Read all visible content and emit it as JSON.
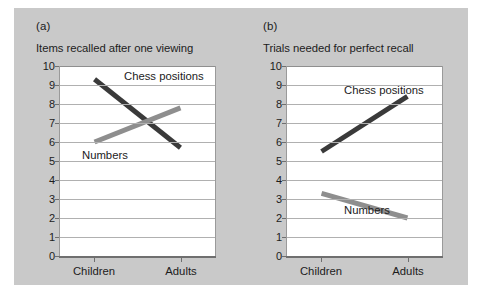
{
  "figure": {
    "background_color": "#c9c9c9",
    "plot_background_color": "#ffffff",
    "gridline_color": "#b0b0b0",
    "series_colors": {
      "chess_positions": "#3a3a3a",
      "numbers": "#8e8e8e"
    }
  },
  "panels": [
    {
      "label": "(a)",
      "title": "Items recalled after one viewing",
      "chess_label": "Chess positions",
      "numbers_label": "Numbers",
      "xticks": [
        "Children",
        "Adults"
      ],
      "yticks": [
        "10",
        "9",
        "8",
        "7",
        "6",
        "5",
        "4",
        "3",
        "2",
        "1",
        "0"
      ]
    },
    {
      "label": "(b)",
      "title": "Trials needed for perfect recall",
      "chess_label": "Chess positions",
      "numbers_label": "Numbers",
      "xticks": [
        "Children",
        "Adults"
      ],
      "yticks": [
        "10",
        "9",
        "8",
        "7",
        "6",
        "5",
        "4",
        "3",
        "2",
        "1",
        "0"
      ]
    }
  ],
  "chart_data": [
    {
      "type": "line",
      "title": "Items recalled after one viewing",
      "panel": "(a)",
      "xlabel": "",
      "ylabel": "",
      "categories": [
        "Children",
        "Adults"
      ],
      "ylim": [
        0,
        10
      ],
      "yticks": [
        0,
        1,
        2,
        3,
        4,
        5,
        6,
        7,
        8,
        9,
        10
      ],
      "grid": true,
      "legend": "inline-labels",
      "series": [
        {
          "name": "Chess positions",
          "values": [
            9.3,
            5.7
          ],
          "color": "#3a3a3a"
        },
        {
          "name": "Numbers",
          "values": [
            6.0,
            7.8
          ],
          "color": "#8e8e8e"
        }
      ]
    },
    {
      "type": "line",
      "title": "Trials needed for perfect recall",
      "panel": "(b)",
      "xlabel": "",
      "ylabel": "",
      "categories": [
        "Children",
        "Adults"
      ],
      "ylim": [
        0,
        10
      ],
      "yticks": [
        0,
        1,
        2,
        3,
        4,
        5,
        6,
        7,
        8,
        9,
        10
      ],
      "grid": true,
      "legend": "inline-labels",
      "series": [
        {
          "name": "Chess positions",
          "values": [
            5.5,
            8.4
          ],
          "color": "#3a3a3a"
        },
        {
          "name": "Numbers",
          "values": [
            3.3,
            2.0
          ],
          "color": "#8e8e8e"
        }
      ]
    }
  ]
}
